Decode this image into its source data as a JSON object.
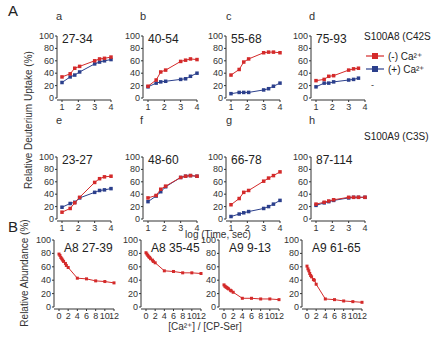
{
  "figure": {
    "panel_A_label": "A",
    "panel_B_label": "B",
    "A_ylabel": "Relative Deuterium Uptake (%)",
    "A_xlabel": "log (Time, sec)",
    "B_ylabel": "Relative Abundance (%)",
    "B_xlabel": "[Ca²⁺] / [CP-Ser]",
    "protein_row1": "S100A8 (C42S",
    "protein_row2": "S100A9 (C3S)",
    "legend": [
      {
        "label": "(-) Ca²⁺",
        "color": "#d42a2a"
      },
      {
        "label": "(+) Ca²⁺",
        "color": "#2b3f8c"
      }
    ],
    "trailing_dash": "-"
  },
  "colors": {
    "minus_ca": "#d42a2a",
    "plus_ca": "#2b3f8c",
    "axis": "#333333"
  },
  "chart_data": [
    {
      "id": "a",
      "type": "line",
      "title": "27-34",
      "xlabel": "log (Time, sec)",
      "ylabel": "Relative Deuterium Uptake (%)",
      "xlim": [
        1,
        4
      ],
      "ylim": [
        0,
        100
      ],
      "xticks": [
        1,
        2,
        3,
        4
      ],
      "yticks": [
        0,
        20,
        40,
        60,
        80,
        100
      ],
      "x": [
        1,
        1.5,
        1.78,
        2.08,
        3,
        3.3,
        3.6,
        4
      ],
      "series": [
        {
          "name": "(-) Ca2+",
          "values": [
            34,
            39,
            48,
            51,
            60,
            63,
            64,
            66
          ]
        },
        {
          "name": "(+) Ca2+",
          "values": [
            25,
            34,
            37,
            42,
            55,
            58,
            60,
            62
          ]
        }
      ]
    },
    {
      "id": "b",
      "type": "line",
      "title": "40-54",
      "xlim": [
        1,
        4
      ],
      "ylim": [
        0,
        100
      ],
      "xticks": [
        1,
        2,
        3,
        4
      ],
      "yticks": [
        0,
        20,
        40,
        60,
        80,
        100
      ],
      "x": [
        1,
        1.5,
        1.78,
        2.08,
        3,
        3.3,
        3.6,
        4
      ],
      "series": [
        {
          "name": "(-) Ca2+",
          "values": [
            19,
            29,
            42,
            45,
            59,
            61,
            63,
            62
          ]
        },
        {
          "name": "(+) Ca2+",
          "values": [
            18,
            24,
            26,
            27,
            30,
            31,
            35,
            40
          ]
        }
      ]
    },
    {
      "id": "c",
      "type": "line",
      "title": "55-68",
      "xlim": [
        1,
        4
      ],
      "ylim": [
        0,
        100
      ],
      "xticks": [
        1,
        2,
        3,
        4
      ],
      "yticks": [
        0,
        20,
        40,
        60,
        80,
        100
      ],
      "x": [
        1,
        1.5,
        1.78,
        2.08,
        3,
        3.3,
        3.6,
        4
      ],
      "series": [
        {
          "name": "(-) Ca2+",
          "values": [
            37,
            46,
            58,
            63,
            73,
            74,
            74,
            73
          ]
        },
        {
          "name": "(+) Ca2+",
          "values": [
            7,
            9,
            9,
            9,
            13,
            15,
            19,
            24
          ]
        }
      ]
    },
    {
      "id": "d",
      "type": "line",
      "title": "75-93",
      "xlim": [
        1,
        4
      ],
      "ylim": [
        0,
        100
      ],
      "xticks": [
        1,
        2,
        3,
        4
      ],
      "yticks": [
        0,
        20,
        40,
        60,
        80,
        100
      ],
      "x": [
        1,
        1.5,
        1.78,
        2.08,
        3,
        3.3,
        3.6
      ],
      "series": [
        {
          "name": "(-) Ca2+",
          "values": [
            28,
            30,
            35,
            36,
            45,
            47,
            48
          ]
        },
        {
          "name": "(+) Ca2+",
          "values": [
            18,
            24,
            24,
            26,
            29,
            30,
            32
          ]
        }
      ]
    },
    {
      "id": "e",
      "type": "line",
      "title": "23-27",
      "xlim": [
        1,
        4
      ],
      "ylim": [
        0,
        100
      ],
      "xticks": [
        1,
        2,
        3,
        4
      ],
      "yticks": [
        0,
        20,
        40,
        60,
        80,
        100
      ],
      "x": [
        1,
        1.5,
        1.78,
        2.08,
        3,
        3.3,
        3.6,
        4
      ],
      "series": [
        {
          "name": "(-) Ca2+",
          "values": [
            11,
            17,
            26,
            35,
            59,
            65,
            68,
            69
          ]
        },
        {
          "name": "(+) Ca2+",
          "values": [
            19,
            25,
            27,
            34,
            43,
            46,
            47,
            49
          ]
        }
      ]
    },
    {
      "id": "f",
      "type": "line",
      "title": "48-60",
      "xlim": [
        1,
        4
      ],
      "ylim": [
        0,
        100
      ],
      "xticks": [
        1,
        2,
        3,
        4
      ],
      "yticks": [
        0,
        20,
        40,
        60,
        80,
        100
      ],
      "x": [
        1,
        1.5,
        1.78,
        2.08,
        3,
        3.3,
        3.6,
        4
      ],
      "series": [
        {
          "name": "(-) Ca2+",
          "values": [
            34,
            38,
            48,
            53,
            67,
            69,
            70,
            69
          ]
        },
        {
          "name": "(+) Ca2+",
          "values": [
            28,
            37,
            44,
            52,
            67,
            69,
            70,
            69
          ]
        }
      ]
    },
    {
      "id": "g",
      "type": "line",
      "title": "66-78",
      "xlim": [
        1,
        4
      ],
      "ylim": [
        0,
        100
      ],
      "xticks": [
        1,
        2,
        3,
        4
      ],
      "yticks": [
        0,
        20,
        40,
        60,
        80,
        100
      ],
      "x": [
        1,
        1.5,
        1.78,
        2.08,
        3,
        3.3,
        3.6,
        4
      ],
      "series": [
        {
          "name": "(-) Ca2+",
          "values": [
            23,
            33,
            43,
            46,
            61,
            66,
            70,
            76
          ]
        },
        {
          "name": "(+) Ca2+",
          "values": [
            4,
            8,
            10,
            12,
            17,
            20,
            24,
            30
          ]
        }
      ]
    },
    {
      "id": "h",
      "type": "line",
      "title": "87-114",
      "xlim": [
        1,
        4
      ],
      "ylim": [
        0,
        100
      ],
      "xticks": [
        1,
        2,
        3,
        4
      ],
      "yticks": [
        0,
        20,
        40,
        60,
        80,
        100
      ],
      "x": [
        1,
        1.5,
        1.78,
        2.08,
        3,
        3.3,
        3.6,
        4
      ],
      "series": [
        {
          "name": "(-) Ca2+",
          "values": [
            24,
            27,
            29,
            31,
            35,
            35,
            35,
            35
          ]
        },
        {
          "name": "(+) Ca2+",
          "values": [
            22,
            26,
            28,
            30,
            34,
            35,
            35,
            35
          ]
        }
      ]
    },
    {
      "id": "B1",
      "type": "line",
      "title": "A8 27-39",
      "xlabel": "[Ca2+] / [CP-Ser]",
      "ylabel": "Relative Abundance (%)",
      "xlim": [
        0,
        12
      ],
      "ylim": [
        0,
        100
      ],
      "xticks": [
        0,
        2,
        4,
        6,
        8,
        10,
        12
      ],
      "yticks": [
        0,
        20,
        40,
        60,
        80,
        100
      ],
      "x": [
        0,
        0.2,
        0.4,
        0.6,
        0.8,
        1.0,
        1.4,
        1.6,
        2.0,
        4,
        6,
        8,
        10,
        12
      ],
      "series": [
        {
          "name": "(-) Ca2+",
          "values": [
            79,
            77,
            74,
            72,
            70,
            68,
            65,
            62,
            59,
            43,
            42,
            39,
            38,
            36
          ]
        }
      ]
    },
    {
      "id": "B2",
      "type": "line",
      "title": "A8 35-45",
      "xlim": [
        0,
        12
      ],
      "ylim": [
        0,
        100
      ],
      "xticks": [
        0,
        2,
        4,
        6,
        8,
        10,
        12
      ],
      "yticks": [
        0,
        20,
        40,
        60,
        80,
        100
      ],
      "x": [
        0,
        0.2,
        0.4,
        0.6,
        0.8,
        1.0,
        1.4,
        1.6,
        2.0,
        4,
        6,
        8,
        10,
        12
      ],
      "series": [
        {
          "name": "(-) Ca2+",
          "values": [
            81,
            79,
            77,
            75,
            74,
            72,
            70,
            68,
            66,
            54,
            53,
            51,
            51,
            50
          ]
        }
      ]
    },
    {
      "id": "B3",
      "type": "line",
      "title": "A9 9-13",
      "xlim": [
        0,
        12
      ],
      "ylim": [
        0,
        100
      ],
      "xticks": [
        0,
        2,
        4,
        6,
        8,
        10,
        12
      ],
      "yticks": [
        0,
        20,
        40,
        60,
        80,
        100
      ],
      "x": [
        0,
        0.2,
        0.4,
        0.6,
        0.8,
        1.0,
        1.4,
        1.6,
        2.0,
        4,
        6,
        8,
        10,
        12
      ],
      "series": [
        {
          "name": "(-) Ca2+",
          "values": [
            33,
            31,
            30,
            29,
            28,
            27,
            25,
            24,
            22,
            13,
            13,
            12,
            12,
            11
          ]
        }
      ]
    },
    {
      "id": "B4",
      "type": "line",
      "title": "A9 61-65",
      "xlim": [
        0,
        12
      ],
      "ylim": [
        0,
        100
      ],
      "xticks": [
        0,
        2,
        4,
        6,
        8,
        10,
        12
      ],
      "yticks": [
        0,
        20,
        40,
        60,
        80,
        100
      ],
      "x": [
        0,
        0.2,
        0.4,
        0.6,
        0.8,
        1.0,
        1.4,
        1.6,
        2.0,
        4,
        6,
        8,
        10,
        12
      ],
      "series": [
        {
          "name": "(-) Ca2+",
          "values": [
            61,
            57,
            54,
            50,
            47,
            45,
            41,
            40,
            34,
            12,
            11,
            9,
            8,
            7
          ]
        }
      ]
    }
  ],
  "layout": {
    "panels": [
      {
        "id": "a",
        "letter": "a",
        "ax": 57,
        "top": 36,
        "bottom": 98,
        "w": 54,
        "letterX": 56,
        "letterY": 20
      },
      {
        "id": "b",
        "letter": "b",
        "ax": 143,
        "top": 36,
        "bottom": 98,
        "w": 54,
        "letterX": 140,
        "letterY": 20
      },
      {
        "id": "c",
        "letter": "c",
        "ax": 226,
        "top": 36,
        "bottom": 98,
        "w": 54,
        "letterX": 226,
        "letterY": 20
      },
      {
        "id": "d",
        "letter": "d",
        "ax": 311,
        "top": 36,
        "bottom": 98,
        "w": 54,
        "letterX": 309,
        "letterY": 20
      },
      {
        "id": "e",
        "letter": "e",
        "ax": 57,
        "top": 157,
        "bottom": 199,
        "w": 54,
        "letterX": 56,
        "letterY": 124
      },
      {
        "id": "f",
        "letter": "f",
        "ax": 143,
        "top": 157,
        "bottom": 199,
        "w": 54,
        "letterX": 140,
        "letterY": 124
      },
      {
        "id": "g",
        "letter": "g",
        "ax": 226,
        "top": 157,
        "bottom": 199,
        "w": 54,
        "letterX": 226,
        "letterY": 124
      },
      {
        "id": "h",
        "letter": "h",
        "ax": 311,
        "top": 157,
        "bottom": 199,
        "w": 54,
        "letterX": 309,
        "letterY": 124
      },
      {
        "id": "B1",
        "letter": "",
        "ax": 54,
        "top": 240,
        "bottom": 307,
        "w": 60
      },
      {
        "id": "B2",
        "letter": "",
        "ax": 141,
        "top": 240,
        "bottom": 307,
        "w": 60
      },
      {
        "id": "B3",
        "letter": "",
        "ax": 219,
        "top": 240,
        "bottom": 307,
        "w": 60
      },
      {
        "id": "B4",
        "letter": "",
        "ax": 302,
        "top": 240,
        "bottom": 307,
        "w": 60
      }
    ]
  }
}
